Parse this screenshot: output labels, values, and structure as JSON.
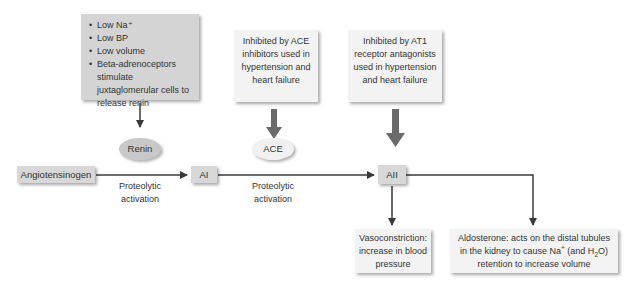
{
  "renin_trigger_box": {
    "items": [
      "Low Na⁺",
      "Low BP",
      "Low volume",
      "Beta-adrenoceptors stimulate juxtaglomerular cells to release renin"
    ]
  },
  "ace_inhibitor_box": {
    "text": "Inhibited by ACE inhibitors used in hypertension and heart failure"
  },
  "at1_box": {
    "text": "Inhibited by AT1 receptor antagonists used in hypertension and heart failure"
  },
  "enzymes": {
    "renin": "Renin",
    "ace": "ACE"
  },
  "nodes": {
    "angiotensinogen": "Angiotensinogen",
    "ai": "AI",
    "aii": "AII"
  },
  "steps": {
    "step1": "Proteolytic activation",
    "step2": "Proteolytic activation"
  },
  "effects": {
    "vasoconstriction": "Vasoconstriction: increase in blood pressure",
    "aldosterone_prefix": "Aldosterone: acts on the distal tubules in the kidney to cause Na",
    "aldosterone_sup": "+",
    "aldosterone_mid": " (and H",
    "aldosterone_sub": "2",
    "aldosterone_suffix": "O) retention to increase volume"
  },
  "colors": {
    "dark_box": "#d4d4d4",
    "light_box": "#f3f3f3",
    "arrow": "#3a3a3a",
    "thick_arrow": "#6a6a6a"
  }
}
